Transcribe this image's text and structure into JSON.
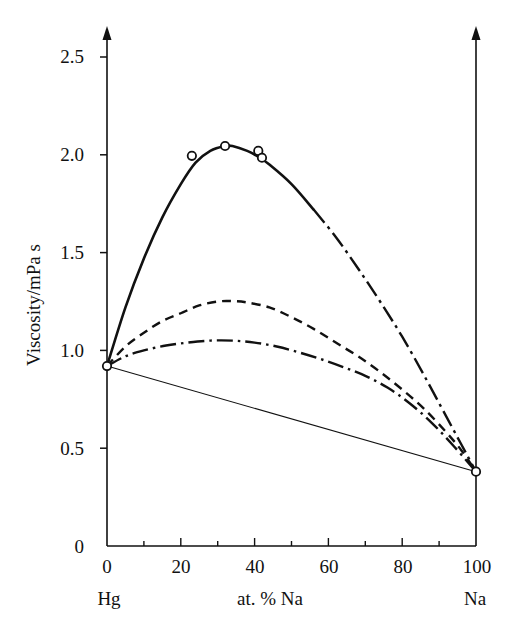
{
  "chart_data": {
    "type": "line",
    "title": "",
    "xlabel": "at. % Na",
    "ylabel": "Viscosity/mPa s",
    "xlim": [
      0,
      100
    ],
    "ylim": [
      0,
      2.6
    ],
    "grid": false,
    "legend": "none",
    "x_ticks": [
      0,
      20,
      40,
      60,
      80,
      100
    ],
    "x_tick_labels": [
      "0",
      "20",
      "40",
      "60",
      "80",
      "100"
    ],
    "x_minor_ticks": [
      10,
      30,
      50,
      70,
      90
    ],
    "y_ticks": [
      0,
      0.5,
      1.0,
      1.5,
      2.0,
      2.5
    ],
    "y_tick_labels": [
      "0",
      "0.5",
      "1.0",
      "1.5",
      "2.0",
      "2.5"
    ],
    "end_label_left": "Hg",
    "end_label_right": "Na",
    "pure_hg_viscosity": 0.92,
    "pure_na_viscosity": 0.38,
    "series": [
      {
        "name": "upper-curve",
        "style": "solid-then-dash-dot",
        "x": [
          0,
          5,
          10,
          15,
          20,
          24,
          28,
          32,
          34,
          38,
          41,
          44,
          50,
          56,
          62,
          68,
          74,
          80,
          86,
          92,
          96,
          100
        ],
        "y": [
          0.92,
          1.22,
          1.47,
          1.68,
          1.85,
          1.96,
          2.02,
          2.045,
          2.045,
          2.02,
          1.99,
          1.95,
          1.85,
          1.72,
          1.58,
          1.42,
          1.25,
          1.07,
          0.87,
          0.66,
          0.52,
          0.38
        ]
      },
      {
        "name": "dashed-curve",
        "style": "dashed",
        "x": [
          0,
          5,
          10,
          15,
          20,
          25,
          30,
          34,
          38,
          44,
          50,
          56,
          62,
          68,
          74,
          80,
          86,
          92,
          96,
          100
        ],
        "y": [
          0.92,
          1.02,
          1.09,
          1.15,
          1.19,
          1.23,
          1.25,
          1.252,
          1.245,
          1.22,
          1.17,
          1.11,
          1.04,
          0.97,
          0.89,
          0.8,
          0.7,
          0.58,
          0.49,
          0.38
        ]
      },
      {
        "name": "dash-dot-curve",
        "style": "dash-dot",
        "x": [
          0,
          5,
          10,
          16,
          22,
          28,
          34,
          40,
          46,
          52,
          58,
          64,
          70,
          76,
          82,
          88,
          94,
          100
        ],
        "y": [
          0.92,
          0.97,
          1.0,
          1.025,
          1.04,
          1.05,
          1.05,
          1.04,
          1.02,
          0.99,
          0.955,
          0.915,
          0.87,
          0.81,
          0.73,
          0.63,
          0.51,
          0.38
        ]
      },
      {
        "name": "ideal-mixing-line",
        "style": "thin-solid-straight",
        "x": [
          0,
          100
        ],
        "y": [
          0.92,
          0.38
        ]
      }
    ],
    "markers": [
      {
        "x": 0,
        "y": 0.92,
        "shape": "open-circle"
      },
      {
        "x": 23,
        "y": 1.995,
        "shape": "open-circle"
      },
      {
        "x": 32,
        "y": 2.045,
        "shape": "open-circle"
      },
      {
        "x": 41,
        "y": 2.02,
        "shape": "open-circle"
      },
      {
        "x": 42,
        "y": 1.985,
        "shape": "open-circle"
      },
      {
        "x": 100,
        "y": 0.38,
        "shape": "open-circle"
      }
    ]
  },
  "axes": {
    "y_axis_title": "Viscosity/mPa s",
    "x_axis_title": "at. % Na",
    "left_component": "Hg",
    "right_component": "Na",
    "ytick_labels": [
      "2.5",
      "2.0",
      "1.5",
      "1.0",
      "0.5",
      "0"
    ],
    "xtick_labels": [
      "0",
      "20",
      "40",
      "60",
      "80",
      "100"
    ]
  },
  "colors": {
    "ink": "#111111",
    "background": "#ffffff"
  }
}
